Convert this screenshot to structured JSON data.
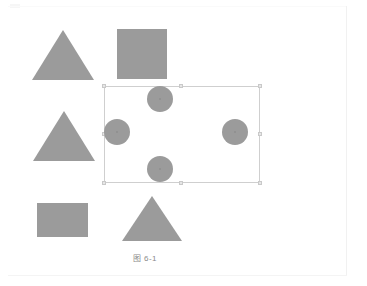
{
  "page": {
    "caption": "图 6-1",
    "background_color": "#ffffff",
    "edge_color": "#f1f1f1"
  },
  "figure": {
    "shape_fill": "#9b9b9b",
    "selection": {
      "name": "selection-rectangle",
      "border_color": "#cfcfcf",
      "handle_fill": "#e6e6e6",
      "handle_border": "#c9c9c9",
      "x": 104,
      "y": 86,
      "width": 156,
      "height": 97,
      "handles": [
        "top-left",
        "top-center",
        "top-right",
        "middle-left",
        "middle-right",
        "bottom-left",
        "bottom-center",
        "bottom-right"
      ]
    },
    "shapes": [
      {
        "id": "triangle-top-left",
        "type": "triangle",
        "x": 32,
        "y": 30,
        "width": 62,
        "height": 50
      },
      {
        "id": "square-top",
        "type": "square",
        "x": 117,
        "y": 29,
        "width": 50,
        "height": 50
      },
      {
        "id": "triangle-middle-left",
        "type": "triangle",
        "x": 33,
        "y": 111,
        "width": 62,
        "height": 50
      },
      {
        "id": "rectangle-bottom-left",
        "type": "rectangle",
        "x": 37,
        "y": 203,
        "width": 51,
        "height": 34
      },
      {
        "id": "triangle-bottom",
        "type": "triangle",
        "x": 122,
        "y": 196,
        "width": 60,
        "height": 45
      },
      {
        "id": "circle-top",
        "type": "circle",
        "x": 147,
        "y": 86,
        "diameter": 26
      },
      {
        "id": "circle-left",
        "type": "circle",
        "x": 104,
        "y": 119,
        "diameter": 26
      },
      {
        "id": "circle-right",
        "type": "circle",
        "x": 222,
        "y": 119,
        "diameter": 26
      },
      {
        "id": "circle-bottom",
        "type": "circle",
        "x": 147,
        "y": 156,
        "diameter": 26
      }
    ]
  }
}
